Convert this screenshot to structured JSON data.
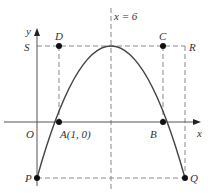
{
  "diagram": {
    "labels": {
      "y_axis": "y",
      "x_axis": "x",
      "origin": "O",
      "symmetry_line": "x = 6",
      "S": "S",
      "D": "D",
      "C": "C",
      "R": "R",
      "A": "A(1, 0)",
      "B": "B",
      "P": "P",
      "Q": "Q"
    },
    "curve": "downward parabola through A(1, 0) and B, vertex on x = 6",
    "colors": {
      "axis": "#555555",
      "curve": "#444444",
      "dashed": "#888888",
      "point": "#111111"
    }
  }
}
